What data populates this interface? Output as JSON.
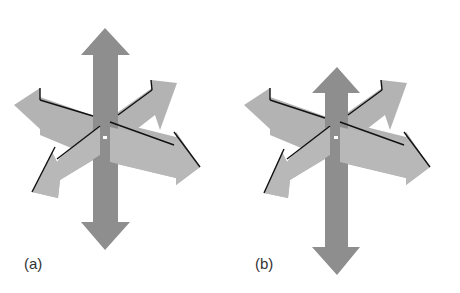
{
  "figure": {
    "panels": [
      {
        "label": "(a)",
        "description": "3D coordinate axes with vertical arrow drawn behind"
      },
      {
        "label": "(b)",
        "description": "3D coordinate axes with vertical arrow drawn in front, shifted down"
      }
    ],
    "colors": {
      "vertical_arrow": "#8e8e8e",
      "oblique_arrows": "#b3b3b3",
      "edge_lines": "#111111",
      "center_dot": "#ffffff"
    }
  }
}
